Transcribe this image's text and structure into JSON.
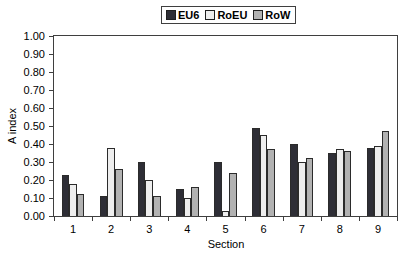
{
  "chart_data": {
    "type": "bar",
    "title": "",
    "xlabel": "Section",
    "ylabel": "A index",
    "categories": [
      "1",
      "2",
      "3",
      "4",
      "5",
      "6",
      "7",
      "8",
      "9"
    ],
    "series": [
      {
        "name": "EU6",
        "color": "#2e2e36",
        "values": [
          0.23,
          0.11,
          0.3,
          0.15,
          0.3,
          0.49,
          0.4,
          0.35,
          0.38
        ]
      },
      {
        "name": "RoEU",
        "color": "#eeeeee",
        "values": [
          0.18,
          0.38,
          0.2,
          0.1,
          0.03,
          0.45,
          0.3,
          0.37,
          0.39
        ]
      },
      {
        "name": "RoW",
        "color": "#b2b2b2",
        "values": [
          0.12,
          0.26,
          0.11,
          0.16,
          0.24,
          0.37,
          0.32,
          0.36,
          0.47
        ]
      }
    ],
    "ylim": [
      0.0,
      1.0
    ],
    "ytick_step": 0.1,
    "ytick_labels": [
      "1.00",
      "0.90",
      "0.80",
      "0.70",
      "0.60",
      "0.50",
      "0.40",
      "0.30",
      "0.20",
      "0.10",
      "0.00"
    ],
    "grid": false,
    "legend_position": "top-center",
    "colors": {
      "axis": "#3f3f3f",
      "bar_outline": "#2b2b2b",
      "background": "#ffffff",
      "text": "#000000"
    }
  }
}
